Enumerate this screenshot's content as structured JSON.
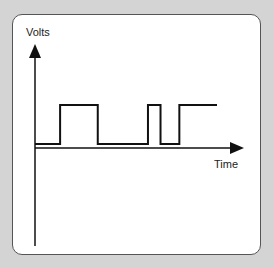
{
  "diagram": {
    "y_axis_label": "Volts",
    "x_axis_label": "Time",
    "signal": {
      "type": "square-wave",
      "levels": [
        "low",
        "high"
      ],
      "sequence": [
        {
          "level": "low",
          "duration": 4
        },
        {
          "level": "high",
          "duration": 6
        },
        {
          "level": "low",
          "duration": 8
        },
        {
          "level": "high",
          "duration": 2
        },
        {
          "level": "low",
          "duration": 3
        },
        {
          "level": "high",
          "duration": 6
        }
      ]
    },
    "colors": {
      "line": "#111111",
      "axis": "#111111",
      "background": "#ffffff",
      "frame": "#d4d4d4"
    }
  }
}
